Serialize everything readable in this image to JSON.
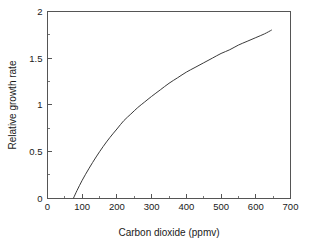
{
  "chart_data": {
    "type": "line",
    "title": "",
    "subtitle": "",
    "xlabel": "Carbon dioxide (ppmv)",
    "ylabel": "Relative growth rate",
    "xlim": [
      0,
      700
    ],
    "ylim": [
      0,
      2
    ],
    "xticks": [
      0,
      100,
      200,
      300,
      400,
      500,
      600,
      700
    ],
    "xtick_labels": [
      "0",
      "100",
      "200",
      "300",
      "400",
      "500",
      "600",
      "700"
    ],
    "xminor_step": 50,
    "yticks": [
      0,
      0.5,
      1,
      1.5,
      2
    ],
    "ytick_labels": [
      "0",
      "0.5",
      "1",
      "1.5",
      "2"
    ],
    "yminor_step": 0.25,
    "grid": false,
    "legend": null,
    "legend_position": "none",
    "frame": "box",
    "series": [
      {
        "name": "Relative growth rate",
        "color": "#3a3a3a",
        "line_width": 1,
        "x": [
          75,
          85,
          100,
          120,
          140,
          160,
          180,
          200,
          220,
          240,
          260,
          280,
          300,
          325,
          350,
          375,
          400,
          425,
          450,
          475,
          500,
          525,
          550,
          575,
          600,
          625,
          645
        ],
        "y": [
          0.0,
          0.08,
          0.19,
          0.32,
          0.44,
          0.55,
          0.65,
          0.74,
          0.83,
          0.9,
          0.97,
          1.03,
          1.09,
          1.16,
          1.23,
          1.29,
          1.35,
          1.4,
          1.45,
          1.5,
          1.55,
          1.59,
          1.64,
          1.68,
          1.72,
          1.76,
          1.8
        ]
      }
    ],
    "annotations": []
  },
  "axes": {
    "x_axis_title": "Carbon dioxide (ppmv)",
    "y_axis_title": "Relative growth rate"
  },
  "colors": {
    "background": "#ffffff",
    "frame": "#555555",
    "curve": "#3a3a3a",
    "text": "#1a1a1a"
  }
}
